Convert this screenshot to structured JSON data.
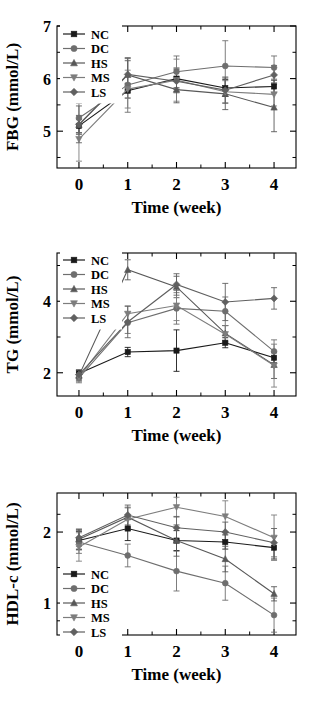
{
  "figure": {
    "series_names": [
      "NC",
      "DC",
      "HS",
      "MS",
      "LS"
    ],
    "x_axis_label": "Time (week)",
    "x_tick_labels": [
      "0",
      "1",
      "2",
      "3",
      "4"
    ]
  },
  "chart_data": [
    {
      "type": "line",
      "title": "",
      "xlabel": "Time (week)",
      "ylabel": "FBG (mmol/L)",
      "categories": [
        0,
        1,
        2,
        3,
        4
      ],
      "x": [
        0,
        1,
        2,
        3,
        4
      ],
      "xlim": [
        -0.45,
        4.45
      ],
      "ylim": [
        4.3,
        7.0
      ],
      "yticks": [
        5,
        6,
        7
      ],
      "ytick_labels": [
        "5",
        "6",
        "7"
      ],
      "yminorticks": [
        4.5,
        5.5,
        6.5
      ],
      "grid": false,
      "legend_position": "upper-left",
      "series": [
        {
          "name": "NC",
          "marker": "square",
          "color": "#1a1a1a",
          "values": [
            5.1,
            5.77,
            6.0,
            5.82,
            5.85
          ],
          "errors": [
            0.13,
            0.14,
            0.2,
            0.16,
            0.12
          ]
        },
        {
          "name": "DC",
          "marker": "circle",
          "color": "#6e6e6e",
          "values": [
            5.25,
            5.88,
            6.13,
            6.24,
            6.21
          ],
          "errors": [
            0.28,
            0.52,
            0.3,
            0.48,
            0.22
          ]
        },
        {
          "name": "HS",
          "marker": "triangle-up",
          "color": "#585858",
          "values": [
            5.12,
            6.07,
            5.79,
            5.71,
            5.45
          ],
          "errors": [
            0.18,
            0.27,
            0.25,
            0.3,
            0.46
          ]
        },
        {
          "name": "MS",
          "marker": "triangle-down",
          "color": "#7d7d7d",
          "values": [
            4.85,
            5.8,
            5.97,
            5.75,
            5.7
          ],
          "errors": [
            0.42,
            0.36,
            0.4,
            0.21,
            0.22
          ]
        },
        {
          "name": "LS",
          "marker": "diamond",
          "color": "#606060",
          "values": [
            5.13,
            6.08,
            5.95,
            5.78,
            6.07
          ],
          "errors": [
            0.35,
            0.3,
            0.22,
            0.25,
            0.18
          ]
        }
      ]
    },
    {
      "type": "line",
      "title": "",
      "xlabel": "Time (week)",
      "ylabel": "TG (mmol/L)",
      "categories": [
        0,
        1,
        2,
        3,
        4
      ],
      "x": [
        0,
        1,
        2,
        3,
        4
      ],
      "xlim": [
        -0.45,
        4.45
      ],
      "ylim": [
        1.35,
        5.35
      ],
      "yticks": [
        2,
        4
      ],
      "ytick_labels": [
        "2",
        "4"
      ],
      "yminorticks": [
        3,
        5
      ],
      "grid": false,
      "legend_position": "upper-left",
      "series": [
        {
          "name": "NC",
          "marker": "square",
          "color": "#1a1a1a",
          "values": [
            1.98,
            2.58,
            2.62,
            2.84,
            2.42
          ],
          "errors": [
            0.1,
            0.13,
            0.58,
            0.14,
            0.14
          ]
        },
        {
          "name": "DC",
          "marker": "circle",
          "color": "#6e6e6e",
          "values": [
            1.86,
            3.4,
            3.8,
            3.72,
            2.6
          ],
          "errors": [
            0.14,
            0.3,
            0.44,
            0.4,
            0.32
          ]
        },
        {
          "name": "HS",
          "marker": "triangle-up",
          "color": "#585858",
          "values": [
            1.92,
            4.88,
            4.4,
            3.1,
            2.22
          ],
          "errors": [
            0.13,
            0.28,
            0.3,
            0.22,
            0.38
          ]
        },
        {
          "name": "MS",
          "marker": "triangle-down",
          "color": "#7d7d7d",
          "values": [
            1.88,
            3.65,
            3.88,
            3.08,
            2.2
          ],
          "errors": [
            0.12,
            0.22,
            0.42,
            0.24,
            0.6
          ]
        },
        {
          "name": "LS",
          "marker": "diamond",
          "color": "#606060",
          "values": [
            1.95,
            3.42,
            4.47,
            3.98,
            4.08
          ],
          "errors": [
            0.12,
            0.44,
            0.3,
            0.52,
            0.3
          ]
        }
      ]
    },
    {
      "type": "line",
      "title": "",
      "xlabel": "Time (week)",
      "ylabel": "HDL-c (mmol/L)",
      "categories": [
        0,
        1,
        2,
        3,
        4
      ],
      "x": [
        0,
        1,
        2,
        3,
        4
      ],
      "xlim": [
        -0.45,
        4.45
      ],
      "ylim": [
        0.55,
        2.55
      ],
      "yticks": [
        1,
        2
      ],
      "ytick_labels": [
        "1",
        "2"
      ],
      "yminorticks": [
        0.75,
        1.5,
        2.25
      ],
      "grid": false,
      "legend_position": "lower-left",
      "series": [
        {
          "name": "NC",
          "marker": "square",
          "color": "#1a1a1a",
          "values": [
            1.88,
            2.05,
            1.88,
            1.86,
            1.78
          ],
          "errors": [
            0.13,
            0.17,
            0.14,
            0.1,
            0.16
          ]
        },
        {
          "name": "DC",
          "marker": "circle",
          "color": "#6e6e6e",
          "values": [
            1.86,
            1.67,
            1.45,
            1.28,
            0.83
          ],
          "errors": [
            0.16,
            0.16,
            0.28,
            0.24,
            0.24
          ]
        },
        {
          "name": "HS",
          "marker": "triangle-up",
          "color": "#585858",
          "values": [
            1.9,
            2.21,
            1.88,
            1.62,
            1.13
          ],
          "errors": [
            0.14,
            0.14,
            0.22,
            0.18,
            0.1
          ]
        },
        {
          "name": "MS",
          "marker": "triangle-down",
          "color": "#7d7d7d",
          "values": [
            1.79,
            2.18,
            2.35,
            2.22,
            1.92
          ],
          "errors": [
            0.2,
            0.16,
            0.14,
            0.22,
            0.32
          ]
        },
        {
          "name": "LS",
          "marker": "diamond",
          "color": "#606060",
          "values": [
            1.92,
            2.24,
            2.06,
            2.0,
            1.85
          ],
          "errors": [
            0.12,
            0.14,
            0.16,
            0.14,
            0.2
          ]
        }
      ]
    }
  ]
}
